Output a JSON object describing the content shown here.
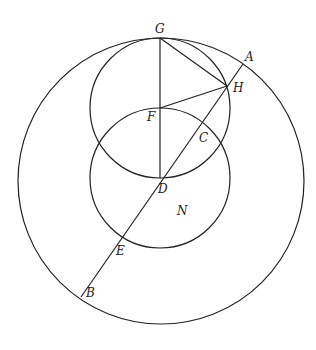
{
  "diagram": {
    "circles": [
      {
        "name": "outer-circle",
        "cx": 161,
        "cy": 181,
        "r": 143
      },
      {
        "name": "upper-circle",
        "cx": 160,
        "cy": 108,
        "r": 70
      },
      {
        "name": "lower-circle",
        "cx": 160,
        "cy": 178,
        "r": 70
      }
    ],
    "segments": [
      {
        "name": "segment-GD",
        "x1": 160,
        "y1": 38,
        "x2": 160,
        "y2": 178
      },
      {
        "name": "segment-GH",
        "x1": 160,
        "y1": 38,
        "x2": 227,
        "y2": 86
      },
      {
        "name": "segment-FH",
        "x1": 160,
        "y1": 108,
        "x2": 227,
        "y2": 86
      },
      {
        "name": "segment-AB",
        "x1": 243,
        "y1": 64,
        "x2": 81,
        "y2": 297
      }
    ],
    "labels": [
      {
        "text": "G",
        "x": 155,
        "y": 33
      },
      {
        "text": "A",
        "x": 245,
        "y": 61
      },
      {
        "text": "H",
        "x": 233,
        "y": 92
      },
      {
        "text": "F",
        "x": 147,
        "y": 121
      },
      {
        "text": "C",
        "x": 199,
        "y": 142
      },
      {
        "text": "D",
        "x": 158,
        "y": 193
      },
      {
        "text": "N",
        "x": 177,
        "y": 215
      },
      {
        "text": "E",
        "x": 116,
        "y": 255
      },
      {
        "text": "B",
        "x": 86,
        "y": 297
      }
    ]
  }
}
